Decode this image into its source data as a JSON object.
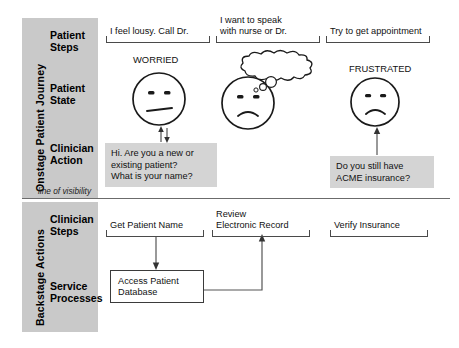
{
  "diagram": {
    "swimlanes": [
      {
        "id": "onstage",
        "band_label": "Onstage Patient Journey",
        "rows": [
          {
            "id": "patient-steps",
            "label": "Patient\nSteps"
          },
          {
            "id": "patient-state",
            "label": "Patient\nState"
          },
          {
            "id": "clinician-action",
            "label": "Clinician\nAction"
          }
        ]
      },
      {
        "id": "backstage",
        "band_label": "Backstage Actions",
        "rows": [
          {
            "id": "clinician-steps",
            "label": "Clinician\nSteps"
          },
          {
            "id": "service-processes",
            "label": "Service\nProcesses"
          }
        ]
      }
    ],
    "line_of_visibility_label": "line of visibility",
    "patient_steps": [
      {
        "id": "step-1",
        "text": "I feel lousy. Call Dr."
      },
      {
        "id": "step-2",
        "text": "I want to speak\nwith nurse or Dr."
      },
      {
        "id": "step-3",
        "text": "Try to get appointment"
      }
    ],
    "patient_states": [
      {
        "id": "state-1",
        "caption": "WORRIED",
        "mood": "worried",
        "thought": null
      },
      {
        "id": "state-2",
        "caption": "",
        "mood": "sad",
        "thought": "Anyone listening?"
      },
      {
        "id": "state-3",
        "caption": "FRUSTRATED",
        "mood": "frustrated",
        "thought": null
      }
    ],
    "clinician_actions": [
      {
        "id": "action-1",
        "text": "Hi. Are you a new or\nexisting patient?\nWhat is your name?"
      },
      {
        "id": "action-2",
        "text": "Do you still have\nACME insurance?"
      }
    ],
    "clinician_steps": [
      {
        "id": "bstep-1",
        "text": "Get Patient Name"
      },
      {
        "id": "bstep-2",
        "text": "Review\nElectronic Record"
      },
      {
        "id": "bstep-3",
        "text": "Verify Insurance"
      }
    ],
    "service_processes": [
      {
        "id": "proc-1",
        "text": "Access Patient\nDatabase"
      }
    ],
    "colors": {
      "band_grey": "#c9c9c9",
      "box_grey": "#d4d4d4",
      "stroke": "#3b3b3b",
      "divider": "#6b6b6b",
      "background": "#ffffff"
    }
  }
}
